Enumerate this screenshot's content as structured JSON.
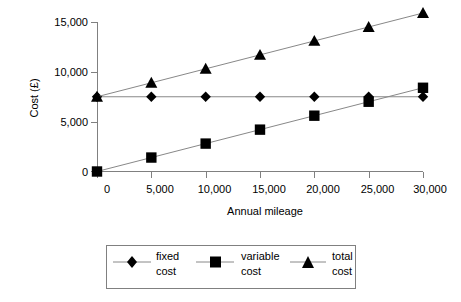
{
  "chart_data": {
    "type": "line",
    "title": "",
    "xlabel": "Annual mileage",
    "ylabel": "Cost (£)",
    "x": [
      0,
      5000,
      10000,
      15000,
      20000,
      25000,
      30000
    ],
    "xticklabels": [
      "0",
      "5,000",
      "10,000",
      "15,000",
      "20,000",
      "25,000",
      "30,000"
    ],
    "yticks": [
      0,
      5000,
      10000,
      15000
    ],
    "yticklabels": [
      "0",
      "5,000",
      "10,000",
      "15,000"
    ],
    "xlim": [
      0,
      30000
    ],
    "ylim": [
      0,
      15000
    ],
    "grid": false,
    "legend_position": "bottom",
    "series": [
      {
        "name": "fixed cost",
        "marker": "diamond",
        "values": [
          7500,
          7500,
          7500,
          7500,
          7500,
          7500,
          7500
        ]
      },
      {
        "name": "variable cost",
        "marker": "square",
        "values": [
          0,
          1400,
          2800,
          4200,
          5600,
          7000,
          8400
        ]
      },
      {
        "name": "total cost",
        "marker": "triangle",
        "values": [
          7500,
          8900,
          10300,
          11700,
          13100,
          14500,
          15900
        ]
      }
    ]
  },
  "axes": {
    "y_title": "Cost (£)",
    "x_title": "Annual mileage",
    "y_tick_0": "0",
    "y_tick_1": "5,000",
    "y_tick_2": "10,000",
    "y_tick_3": "15,000",
    "x_tick_0": "0",
    "x_tick_1": "5,000",
    "x_tick_2": "10,000",
    "x_tick_3": "15,000",
    "x_tick_4": "20,000",
    "x_tick_5": "25,000",
    "x_tick_6": "30,000"
  },
  "legend": {
    "entries": [
      {
        "label_line1": "fixed",
        "label_line2": "cost",
        "marker": "diamond-marker"
      },
      {
        "label_line1": "variable",
        "label_line2": "cost",
        "marker": "square-marker"
      },
      {
        "label_line1": "total",
        "label_line2": "cost",
        "marker": "triangle-marker"
      }
    ]
  },
  "colors": {
    "marker": "#000000",
    "line": "#888888",
    "axis": "#808080",
    "background": "#ffffff"
  }
}
